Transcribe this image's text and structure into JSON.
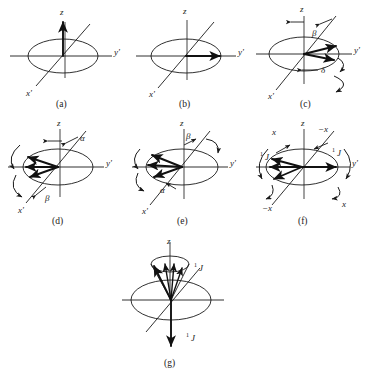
{
  "figure": {
    "background_color": "#ffffff",
    "ink_color": "#1a1a1a",
    "grey_axis_color": "#8a8a8a",
    "width": 372,
    "height": 371
  },
  "axis_labels": {
    "z": "z",
    "y_prime": "y'",
    "x_prime": "x'",
    "x": "x",
    "minus_x": "−x"
  },
  "angles": {
    "alpha": "α",
    "beta": "β",
    "delta": "δ"
  },
  "coupling": {
    "j_sup": "1",
    "j_sym": "J"
  },
  "panels": [
    {
      "id": "a",
      "caption": "(a)",
      "description": "equilibrium magnetization along z",
      "axis_labels": [
        "z",
        "y'",
        "x'"
      ],
      "angle_labels": [],
      "vectors": 1
    },
    {
      "id": "b",
      "caption": "(b)",
      "description": "magnetization rotated onto y' axis",
      "axis_labels": [
        "z",
        "y'",
        "x'"
      ],
      "angle_labels": [],
      "vectors": 1
    },
    {
      "id": "c",
      "caption": "(c)",
      "description": "vectors dephasing by angle delta about beta pulse axis",
      "axis_labels": [
        "z",
        "y'",
        "x'"
      ],
      "angle_labels": [
        "β",
        "δ"
      ],
      "vectors": 2
    },
    {
      "id": "d",
      "caption": "(d)",
      "description": "fan of vectors with alpha and beta pulse angles",
      "axis_labels": [
        "z",
        "y'",
        "x'"
      ],
      "angle_labels": [
        "α",
        "β"
      ],
      "vectors": 3
    },
    {
      "id": "e",
      "caption": "(e)",
      "description": "fan of vectors with beta above and alpha below",
      "axis_labels": [
        "z",
        "y'",
        "x'"
      ],
      "angle_labels": [
        "β",
        "α"
      ],
      "vectors": 3
    },
    {
      "id": "f",
      "caption": "(f)",
      "description": "x and minus x phase labels with one-bond J coupling vectors",
      "axis_labels": [
        "z",
        "y'",
        "x",
        "−x",
        "x",
        "−x"
      ],
      "angle_labels": [],
      "vectors": 4
    },
    {
      "id": "g",
      "caption": "(g)",
      "description": "cone of vectors near plus z and one vector along minus z, labelled with one-bond J",
      "axis_labels": [
        "z"
      ],
      "angle_labels": [],
      "vectors": 4
    }
  ]
}
